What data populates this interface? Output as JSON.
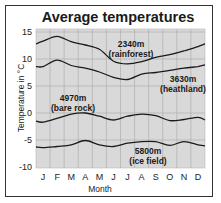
{
  "chart_data": {
    "type": "line",
    "title": "Average temperatures",
    "xlabel": "Month",
    "ylabel": "Temperature in °C",
    "categories": [
      "J",
      "F",
      "M",
      "A",
      "M",
      "J",
      "J",
      "A",
      "S",
      "O",
      "N",
      "D"
    ],
    "yticks": [
      15,
      10,
      5,
      0,
      -5,
      -10
    ],
    "ylim": [
      -10,
      15
    ],
    "grid": true,
    "legend_position": "inline labels",
    "series": [
      {
        "name": "2340m (rainforest)",
        "label_line1": "2340m",
        "label_line2": "(rainforest)",
        "values": [
          13.3,
          14.2,
          13.2,
          12.6,
          11.8,
          9.6,
          9.1,
          9.5,
          10.3,
          10.8,
          11.5,
          12.3
        ],
        "start": 12.8,
        "end": 12.8
      },
      {
        "name": "3630m (heathland)",
        "label_line1": "3630m",
        "label_line2": "(heathland)",
        "values": [
          8.6,
          9.8,
          8.8,
          8.3,
          7.6,
          6.6,
          6.2,
          7.2,
          7.5,
          7.9,
          8.3,
          8.6
        ],
        "start": 8.6,
        "end": 8.9
      },
      {
        "name": "4970m (bare rock)",
        "label_line1": "4970m",
        "label_line2": "(bare rock)",
        "values": [
          -1.7,
          -1.0,
          -0.2,
          0.0,
          -0.6,
          -1.3,
          -0.6,
          -0.2,
          -0.5,
          -1.4,
          -1.2,
          -0.8
        ],
        "start": -1.5,
        "end": -1.3
      },
      {
        "name": "5800m (ice field)",
        "label_line1": "5800m",
        "label_line2": "(ice field)",
        "values": [
          -6.4,
          -6.2,
          -5.9,
          -5.1,
          -5.9,
          -6.2,
          -5.6,
          -5.3,
          -5.3,
          -6.0,
          -5.3,
          -5.9
        ],
        "start": -6.3,
        "end": -6.1
      }
    ]
  },
  "colors": {
    "plot_background": "#d9d9d9",
    "grid": "#a8a8a8",
    "line": "#1a1a1a",
    "frame": "#333333"
  }
}
